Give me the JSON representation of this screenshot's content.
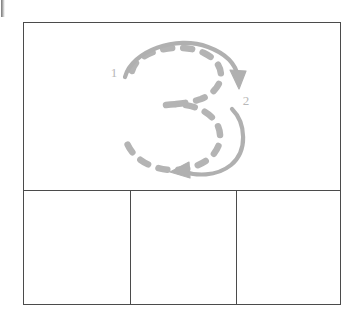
{
  "worksheet": {
    "type": "handwriting-stroke-order-practice",
    "character": "3",
    "demo_cell": {
      "glyph_label": "3",
      "guide_style": "dashed-outline",
      "stroke_count": 2,
      "stroke_labels": [
        {
          "number": "1",
          "x": 135,
          "y": 69
        },
        {
          "number": "2",
          "x": 218,
          "y": 97
        }
      ]
    },
    "practice_cells": [
      {
        "label": "",
        "index": 1
      },
      {
        "label": "",
        "index": 2
      },
      {
        "label": "",
        "index": 3
      }
    ],
    "colors": {
      "frame_line": "#4b4b4b",
      "guide_dash": "#b4b4b4",
      "arrow": "#b0b0b0",
      "stroke_number": "#b8b8b8",
      "paper": "#ffffff"
    }
  },
  "layout": {
    "frame": {
      "x": 23,
      "y": 22,
      "width": 318,
      "height": 283
    },
    "demo_height": 168,
    "dividers_x": [
      130,
      236
    ]
  }
}
